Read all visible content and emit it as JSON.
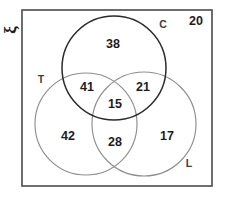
{
  "diagram": {
    "universe_symbol": "ξ",
    "universe_symbol_name": "xi",
    "outside_count": "20",
    "stroke_colors": {
      "rectangle": "#4a4a4a",
      "circle_c": "#2b2b2b",
      "circle_t": "#8e8e8e",
      "circle_l": "#8e8e8e"
    },
    "text_color": "#1d1d1d",
    "background": "#ffffff"
  },
  "sets": [
    {
      "id": "C",
      "label": "C",
      "label_x": 163,
      "label_y": 25,
      "cx": 114,
      "cy": 68,
      "r": 52
    },
    {
      "id": "T",
      "label": "T",
      "label_x": 41,
      "label_y": 80,
      "cx": 86,
      "cy": 124,
      "r": 51
    },
    {
      "id": "L",
      "label": "L",
      "label_x": 189,
      "label_y": 164,
      "cx": 144,
      "cy": 124,
      "r": 52
    }
  ],
  "regions": [
    {
      "id": "c-only",
      "region": "C only",
      "value": "38",
      "x": 113,
      "y": 45
    },
    {
      "id": "ct",
      "region": "C and T",
      "value": "41",
      "x": 87,
      "y": 88
    },
    {
      "id": "cl",
      "region": "C and L",
      "value": "21",
      "x": 143,
      "y": 88
    },
    {
      "id": "ctl",
      "region": "C and T and L",
      "value": "15",
      "x": 115,
      "y": 105
    },
    {
      "id": "t-only",
      "region": "T only",
      "value": "42",
      "x": 68,
      "y": 137
    },
    {
      "id": "tl",
      "region": "T and L",
      "value": "28",
      "x": 115,
      "y": 143
    },
    {
      "id": "l-only",
      "region": "L only",
      "value": "17",
      "x": 167,
      "y": 137
    }
  ],
  "universe_rect": {
    "x": 22,
    "y": 10,
    "width": 190,
    "height": 176
  },
  "outside_label": {
    "x": 196,
    "y": 22
  }
}
